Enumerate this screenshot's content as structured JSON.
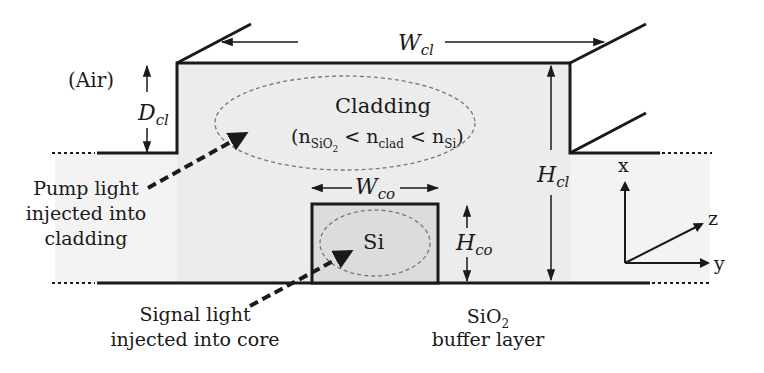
{
  "diagram": {
    "type": "waveguide-cross-section",
    "background_color": "#ffffff",
    "cladding_fill": "#ececec",
    "substrate_fill": "#f3f3f3",
    "core_fill": "#dcdcdc",
    "line_color": "#1a1a1a",
    "labels": {
      "air": "(Air)",
      "d_cl_main": "D",
      "d_cl_sub": "cl",
      "w_cl_main": "W",
      "w_cl_sub": "cl",
      "h_cl_main": "H",
      "h_cl_sub": "cl",
      "w_co_main": "W",
      "w_co_sub": "co",
      "h_co_main": "H",
      "h_co_sub": "co",
      "cladding_title": "Cladding",
      "cladding_index": {
        "open": "(n",
        "sio2_sub": "SiO",
        "sio2_sub2": "2",
        "lt1": " < n",
        "clad_sub": "clad",
        "lt2": " < n",
        "si_sub": "Si",
        "close": ")"
      },
      "core_material": "Si",
      "pump_line1": "Pump light",
      "pump_line2": "injected into",
      "pump_line3": "cladding",
      "signal_line1": "Signal light",
      "signal_line2": "injected into core",
      "buffer_line1_main": "SiO",
      "buffer_line1_sub": "2",
      "buffer_line2": "buffer layer",
      "axis_x": "x",
      "axis_y": "y",
      "axis_z": "z"
    }
  }
}
